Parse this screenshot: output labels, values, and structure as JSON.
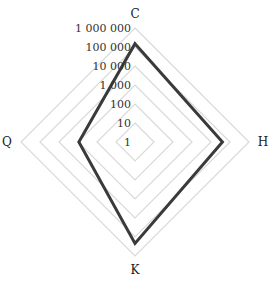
{
  "chart_data": {
    "type": "radar",
    "title": "",
    "scale": "log",
    "categories": [
      "C",
      "H",
      "K",
      "Q"
    ],
    "ticks": [
      "1",
      "10",
      "100",
      "1 000",
      "10 000",
      "100 000",
      "1 000 000"
    ],
    "tick_values": [
      1,
      10,
      100,
      1000,
      10000,
      100000,
      1000000
    ],
    "rlim": [
      1,
      1000000
    ],
    "grid": true,
    "legend": null,
    "series": [
      {
        "name": "Series 1",
        "values": [
          150000,
          40000,
          220000,
          900
        ],
        "color": "#3a3a3a"
      }
    ]
  },
  "style": {
    "grid_color": "#d9d9d9",
    "line_color": "#3a3a3a"
  }
}
